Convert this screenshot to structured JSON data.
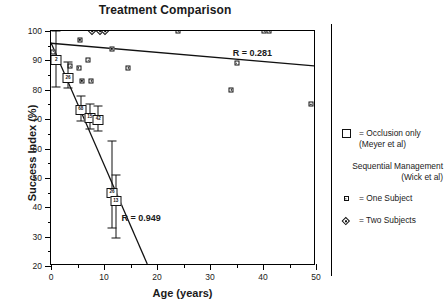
{
  "chart_data": {
    "type": "scatter",
    "title": "Treatment Comparison",
    "xlabel": "Age (years)",
    "ylabel": "Success Index (%)",
    "xlim": [
      0,
      50
    ],
    "ylim": [
      20,
      100
    ],
    "xticks": [
      0,
      10,
      20,
      30,
      40,
      50
    ],
    "xminorticks": [
      5,
      15,
      25,
      35,
      45
    ],
    "yticks": [
      20,
      30,
      40,
      50,
      60,
      70,
      80,
      90,
      100
    ],
    "grid": false,
    "legend_position": "right",
    "series": [
      {
        "name": "Occlusion only (Meyer et al)",
        "marker": "large-box-with-n",
        "points": [
          {
            "x": 1.0,
            "y": 90.0,
            "n": "2",
            "err_low": 81.0,
            "err_high": 100.0
          },
          {
            "x": 3.2,
            "y": 84.0,
            "n": "26",
            "err_low": 80.5,
            "err_high": 89.5
          },
          {
            "x": 5.6,
            "y": 73.2,
            "n": "68",
            "err_low": 69.5,
            "err_high": 78.0
          },
          {
            "x": 7.3,
            "y": 70.5,
            "n": "15",
            "err_low": 66.5,
            "err_high": 75.0
          },
          {
            "x": 8.9,
            "y": 69.8,
            "n": "42",
            "err_low": 66.0,
            "err_high": 74.5
          },
          {
            "x": 11.5,
            "y": 45.0,
            "n": "26",
            "err_low": 33.0,
            "err_high": 62.5
          },
          {
            "x": 12.2,
            "y": 42.0,
            "n": "13",
            "err_low": 29.5,
            "err_high": 51.0
          }
        ]
      },
      {
        "name": "One Subject (Wick et al)",
        "marker": "small-square",
        "points": [
          {
            "x": 0.4,
            "y": 93.0
          },
          {
            "x": 5.4,
            "y": 97.0
          },
          {
            "x": 5.2,
            "y": 87.5
          },
          {
            "x": 7.0,
            "y": 90.0
          },
          {
            "x": 5.8,
            "y": 83.0
          },
          {
            "x": 7.6,
            "y": 83.0
          },
          {
            "x": 3.6,
            "y": 88.0
          },
          {
            "x": 11.5,
            "y": 94.0
          },
          {
            "x": 14.6,
            "y": 87.5
          },
          {
            "x": 24.0,
            "y": 100.0
          },
          {
            "x": 34.0,
            "y": 80.0
          },
          {
            "x": 35.0,
            "y": 89.0
          },
          {
            "x": 40.2,
            "y": 100.0
          },
          {
            "x": 41.2,
            "y": 100.0
          },
          {
            "x": 49.0,
            "y": 75.0
          }
        ]
      },
      {
        "name": "Two Subjects (Wick et al)",
        "marker": "diamond",
        "points": [
          {
            "x": 7.8,
            "y": 100.0
          },
          {
            "x": 9.3,
            "y": 100.0
          },
          {
            "x": 10.2,
            "y": 100.0
          }
        ]
      }
    ],
    "trendlines": [
      {
        "name": "Sequential management trend",
        "label": "R = 0.281",
        "x0": 0.0,
        "y0": 95.8,
        "x1": 50.0,
        "y1": 88.0
      },
      {
        "name": "Occlusion only trend",
        "label": "R = 0.949",
        "x0": 0.0,
        "y0": 96.0,
        "x1": 18.3,
        "y1": 20.0
      }
    ],
    "annotations": [
      {
        "text": "R = 0.281",
        "x": 38.0,
        "y": 92.5
      },
      {
        "text": "R = 0.949",
        "x": 17.0,
        "y": 36.5
      }
    ]
  },
  "legend": {
    "occlusion": {
      "symbol": "large-open-square",
      "line1": "= Occlusion only",
      "line2": "(Meyer  et al)"
    },
    "sequential_heading": {
      "line1": "Sequential Management",
      "line2": "(Wick  et al)"
    },
    "one_subject": {
      "symbol": "small-square",
      "label": "= One Subject"
    },
    "two_subjects": {
      "symbol": "diamond",
      "label": "= Two Subjects"
    }
  },
  "colors": {
    "ink": "#111111",
    "background": "#ffffff"
  }
}
